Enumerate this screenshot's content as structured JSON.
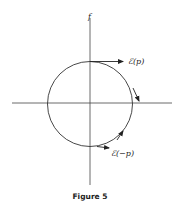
{
  "figure": {
    "caption": "Figure 5",
    "axis_label_vertical": "f",
    "label_top_vector": "ℰ(p)",
    "label_bottom_vector": "ℰ(−p)"
  },
  "colors": {
    "ink": "#222222",
    "background": "#ffffff"
  }
}
